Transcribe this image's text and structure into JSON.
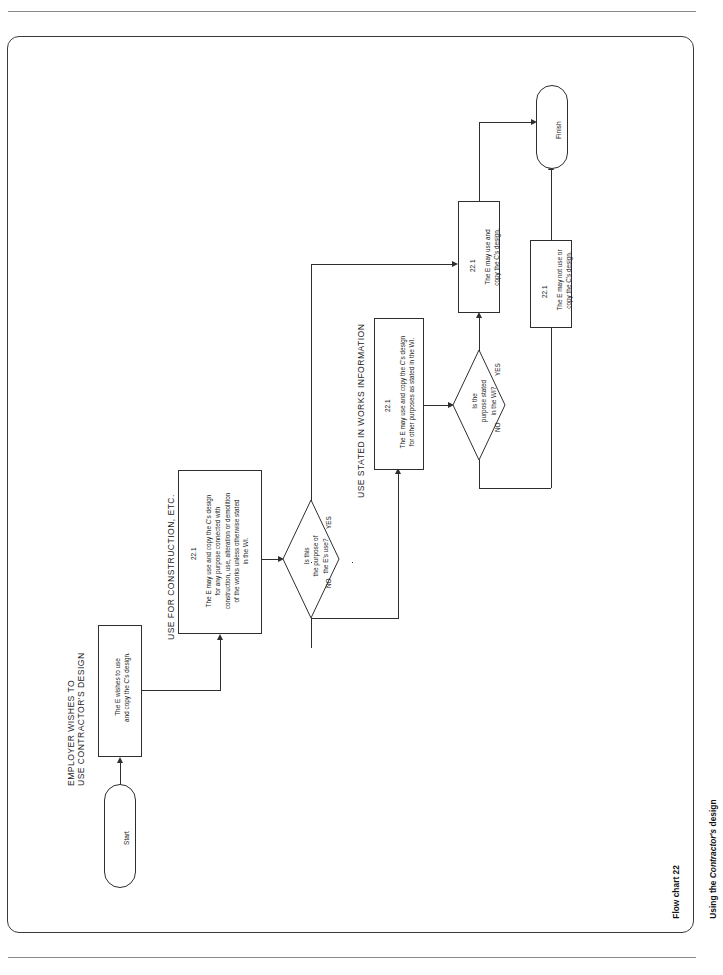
{
  "document": {
    "caption_line1": "Flow chart 22",
    "caption_line2_prefix": "Using the ",
    "caption_line2_italic": "Contractor's",
    "caption_line2_suffix": " design"
  },
  "sections": [
    {
      "id": "employer",
      "label": "EMPLOYER WISHES TO\nUSE CONTRACTOR'S DESIGN"
    },
    {
      "id": "construction",
      "label": "USE FOR CONSTRUCTION, ETC."
    },
    {
      "id": "works_information",
      "label": "USE STATED IN WORKS INFORMATION"
    }
  ],
  "nodes": {
    "start": {
      "type": "terminator",
      "label": "Start"
    },
    "finish": {
      "type": "terminator",
      "label": "Finish"
    },
    "wish": {
      "type": "process",
      "clause": "",
      "text": "The E wishes to use\nand copy the C's design."
    },
    "construction_use": {
      "type": "process",
      "clause": "22.1",
      "text": "The E may use and copy the C's design\nfor any purpose connected with\nconstruction, use, alteration or demolition\nof the works unless otherwise stated\nin the WI."
    },
    "purpose_decision": {
      "type": "decision",
      "text": "Is this\nthe purpose of\nthe E's use?",
      "yes": "YES",
      "no": "NO"
    },
    "other_purposes": {
      "type": "process",
      "clause": "22.1",
      "text": "The E may use and copy the C's design\nfor other purposes as stated in the WI."
    },
    "stated_decision": {
      "type": "decision",
      "text": "Is the\npurpose stated\nin the WI?",
      "yes": "YES",
      "no": "NO"
    },
    "may_use": {
      "type": "process",
      "clause": "22.1",
      "text": "The E may use and\ncopy the C's design."
    },
    "may_not_use": {
      "type": "process",
      "clause": "22.1",
      "text": "The E may not use or\ncopy the C's design."
    }
  },
  "colors": {
    "stroke": "#2e2e2e",
    "frame": "#3b3b3b",
    "rule": "#8a8a8a",
    "text": "#1a1a1a",
    "background": "#ffffff"
  }
}
